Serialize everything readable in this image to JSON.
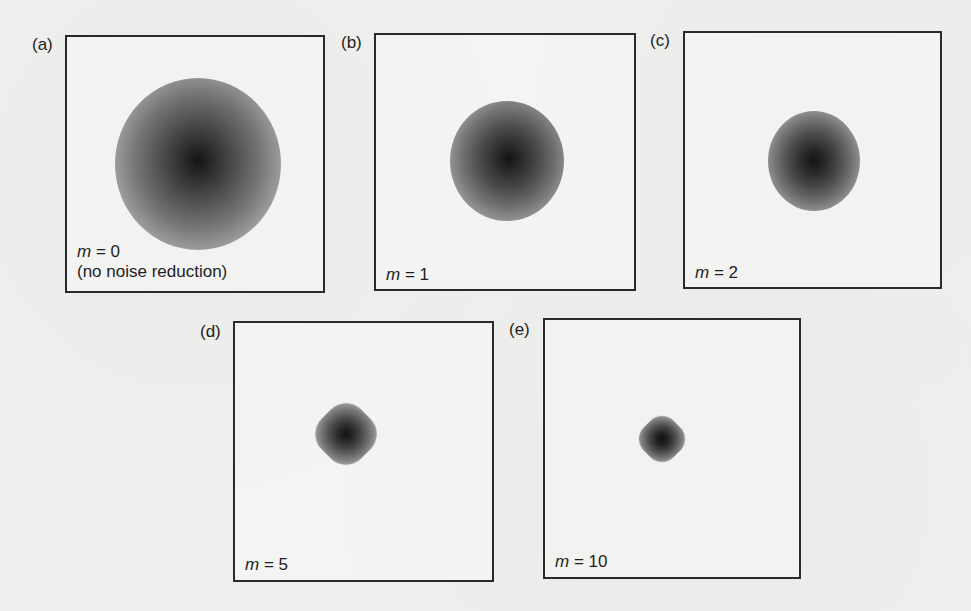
{
  "figure": {
    "panels": [
      {
        "id": "a",
        "label": "(a)",
        "param_var": "m",
        "param_eq": " = 0",
        "note": "(no noise reduction)",
        "blob_shape": "round-rough",
        "blob_size": "large"
      },
      {
        "id": "b",
        "label": "(b)",
        "param_var": "m",
        "param_eq": " = 1",
        "note": "",
        "blob_shape": "round",
        "blob_size": "medium"
      },
      {
        "id": "c",
        "label": "(c)",
        "param_var": "m",
        "param_eq": " = 2",
        "note": "",
        "blob_shape": "round",
        "blob_size": "medium-small"
      },
      {
        "id": "d",
        "label": "(d)",
        "param_var": "m",
        "param_eq": " = 5",
        "note": "",
        "blob_shape": "diamond-ish",
        "blob_size": "small"
      },
      {
        "id": "e",
        "label": "(e)",
        "param_var": "m",
        "param_eq": " = 10",
        "note": "",
        "blob_shape": "diamond",
        "blob_size": "smallest"
      }
    ],
    "colors": {
      "paper": "#efefed",
      "frame": "#2a2a2a",
      "text": "#1e1e1e",
      "blob_core": "#141414"
    }
  }
}
